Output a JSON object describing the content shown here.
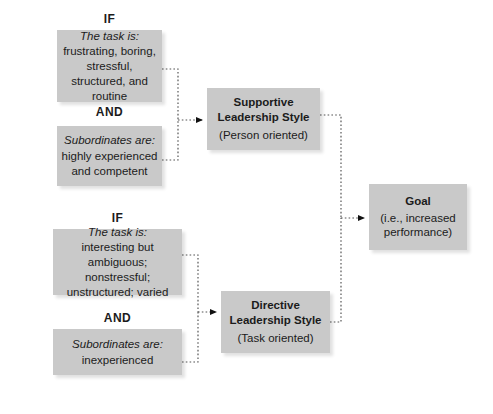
{
  "diagram": {
    "accent_box_color": "#c9c9c9",
    "connector_color": "#555555",
    "operators": [
      {
        "id": "if-top",
        "label": "IF"
      },
      {
        "id": "and-top",
        "label": "AND"
      },
      {
        "id": "if-bottom",
        "label": "IF"
      },
      {
        "id": "and-bottom",
        "label": "AND"
      }
    ],
    "conditions": [
      {
        "id": "task-top",
        "head": "The task is:",
        "body": "frustrating, boring, stressful, structured, and routine"
      },
      {
        "id": "subordinates-top",
        "head": "Subordinates are:",
        "body": "highly experienced and competent"
      },
      {
        "id": "task-bottom",
        "head": "The task is:",
        "body": "interesting but ambiguous; nonstressful; unstructured; varied"
      },
      {
        "id": "subordinates-bottom",
        "head": "Subordinates are:",
        "body": "inexperienced"
      }
    ],
    "styles": [
      {
        "id": "supportive",
        "title": "Supportive Leadership Style",
        "subtitle": "(Person oriented)"
      },
      {
        "id": "directive",
        "title": "Directive Leadership Style",
        "subtitle": "(Task oriented)"
      }
    ],
    "goal": {
      "id": "goal",
      "title": "Goal",
      "subtitle": "(i.e., increased performance)"
    }
  }
}
